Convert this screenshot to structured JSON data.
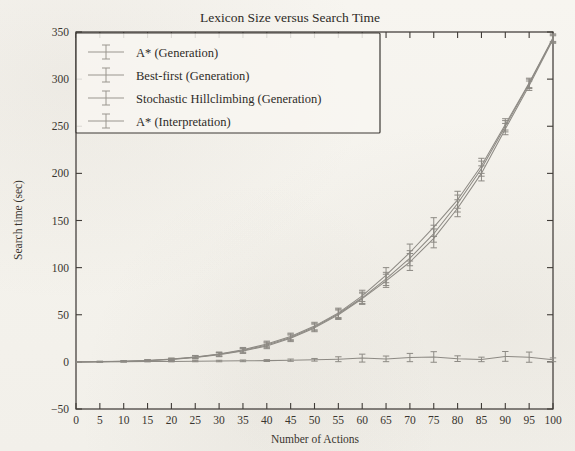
{
  "chart_data": {
    "type": "line",
    "title": "Lexicon Size versus Search Time",
    "xlabel": "Number of Actions",
    "ylabel": "Search time (sec)",
    "xlim": [
      0,
      100
    ],
    "ylim": [
      -50,
      350
    ],
    "xticks": [
      0,
      5,
      10,
      15,
      20,
      25,
      30,
      35,
      40,
      45,
      50,
      55,
      60,
      65,
      70,
      75,
      80,
      85,
      90,
      95,
      100
    ],
    "yticks": [
      -50,
      0,
      50,
      100,
      150,
      200,
      250,
      300,
      350
    ],
    "grid": false,
    "legend_position": "upper-left",
    "error_bars": true,
    "x": [
      0,
      5,
      10,
      15,
      20,
      25,
      30,
      35,
      40,
      45,
      50,
      55,
      60,
      65,
      70,
      75,
      80,
      85,
      90,
      95,
      100
    ],
    "series": [
      {
        "name": "A* (Generation)",
        "values": [
          0,
          0.2,
          0.6,
          1.4,
          2.8,
          5,
          8,
          12,
          18,
          26,
          37,
          51,
          68,
          88,
          110,
          136,
          168,
          205,
          250,
          295,
          343
        ],
        "errors": [
          0,
          0.3,
          0.5,
          0.8,
          1,
          1.5,
          2,
          2.5,
          3,
          3.5,
          4,
          5,
          6,
          7,
          8,
          9,
          9,
          8,
          6,
          5,
          4
        ]
      },
      {
        "name": "Best-first (Generation)",
        "values": [
          0,
          0.2,
          0.5,
          1.2,
          2.5,
          4.6,
          7.5,
          11.5,
          17,
          25,
          36,
          50,
          67,
          86,
          106,
          131,
          163,
          200,
          247,
          293,
          342
        ],
        "errors": [
          0,
          0.3,
          0.5,
          0.8,
          1,
          1.5,
          2,
          2.5,
          3,
          3.5,
          4,
          5,
          6,
          7,
          9,
          10,
          9,
          8,
          6,
          5,
          4
        ]
      },
      {
        "name": "Stochastic Hillclimbing (Generation)",
        "values": [
          0,
          0.3,
          0.7,
          1.5,
          3,
          5.3,
          8.4,
          12.8,
          19,
          27,
          38,
          52,
          70,
          92,
          116,
          143,
          172,
          208,
          252,
          296,
          344
        ],
        "errors": [
          0,
          0.3,
          0.5,
          0.8,
          1,
          1.5,
          2,
          2.5,
          3,
          3.5,
          4,
          5,
          6,
          8,
          9,
          10,
          9,
          8,
          6,
          5,
          4
        ]
      },
      {
        "name": "A* (Interpretation)",
        "values": [
          0,
          0.2,
          0.3,
          0.4,
          0.5,
          0.7,
          0.9,
          1.1,
          1.4,
          1.8,
          2.2,
          2.8,
          4.0,
          3.2,
          4.6,
          5.2,
          3.4,
          2.6,
          5.8,
          5.0,
          2.2
        ],
        "errors": [
          0,
          0.2,
          0.3,
          0.4,
          0.5,
          0.6,
          0.8,
          0.9,
          1.0,
          1.2,
          1.4,
          2.6,
          4.2,
          3.0,
          4.4,
          5.6,
          3.0,
          2.4,
          5.2,
          5.4,
          2.0
        ]
      }
    ]
  },
  "axes": {
    "y_title": "Search time (sec)",
    "x_title": "Number of Actions"
  }
}
